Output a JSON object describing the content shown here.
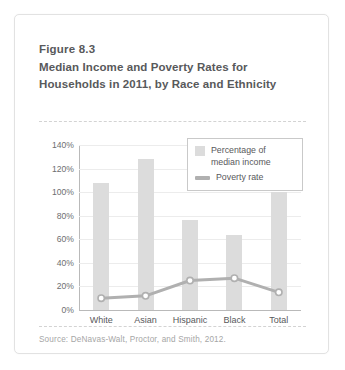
{
  "figure": {
    "number": "Figure 8.3",
    "title": "Median Income and Poverty Rates for Households in 2011, by Race and Ethnicity",
    "source": "Source: DeNavas-Walt, Proctor, and Smith, 2012."
  },
  "colors": {
    "bar": "#dcdcdc",
    "line": "#b0b0b0",
    "marker_fill": "#ffffff",
    "gridline": "#ececec",
    "axis": "#b9b9b9",
    "title_text": "#58595b",
    "source_text": "#a6a6a6",
    "card_border": "#e2e2e2"
  },
  "chart_data": {
    "type": "bar",
    "title": "Median Income and Poverty Rates for Households in 2011, by Race and Ethnicity",
    "xlabel": "",
    "ylabel": "",
    "categories": [
      "White",
      "Asian",
      "Hispanic",
      "Black",
      "Total"
    ],
    "series": [
      {
        "name": "Percentage of median income",
        "type": "bar",
        "values": [
          108,
          128,
          76,
          64,
          100
        ]
      },
      {
        "name": "Poverty rate",
        "type": "line",
        "values": [
          10,
          12,
          25,
          27,
          15
        ]
      }
    ],
    "ylim": [
      0,
      140
    ],
    "ytick_values": [
      0,
      20,
      40,
      60,
      80,
      100,
      120,
      140
    ],
    "ytick_labels": [
      "0%",
      "20%",
      "40%",
      "60%",
      "80%",
      "100%",
      "120%",
      "140%"
    ],
    "grid": true,
    "legend_position": "upper right",
    "legend_entries": [
      "Percentage of median income",
      "Poverty rate"
    ]
  },
  "legend": {
    "item1_line1": "Percentage of",
    "item1_line2": "median income",
    "item2": "Poverty rate"
  }
}
